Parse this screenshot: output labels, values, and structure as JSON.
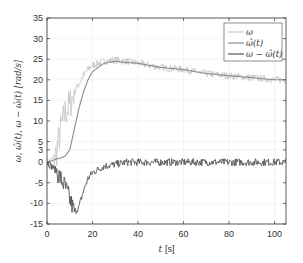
{
  "chart_data": {
    "type": "line",
    "title": "",
    "xlabel": "t [s]",
    "ylabel": "ω, ω̂(t), ω − ω̂(t) [rad/s]",
    "xlim": [
      0,
      105
    ],
    "ylim": [
      -15,
      35
    ],
    "xticks": [
      0,
      20,
      40,
      60,
      80,
      100
    ],
    "yticks": [
      -15,
      -10,
      -5,
      0,
      3,
      5,
      10,
      15,
      20,
      25,
      30,
      35
    ],
    "grid": true,
    "legend_position": "upper right",
    "x": [
      0,
      2,
      4,
      6,
      8,
      10,
      12,
      14,
      16,
      18,
      20,
      25,
      30,
      35,
      40,
      50,
      60,
      70,
      80,
      90,
      100,
      105
    ],
    "series": [
      {
        "name": "ω",
        "color": "#c8c8c8",
        "noisy": true,
        "values": [
          0,
          0.5,
          2,
          8,
          12,
          14,
          17,
          19,
          21,
          22.5,
          23.5,
          24.5,
          24.8,
          24.5,
          24,
          23,
          22.5,
          21.5,
          21,
          20.5,
          20,
          20
        ]
      },
      {
        "name": "ω̂(t)",
        "color": "#8c8c8c",
        "noisy": false,
        "values": [
          0,
          0.3,
          0.8,
          1,
          1.5,
          3,
          8,
          13,
          17,
          20,
          22,
          24,
          24.5,
          24.2,
          24,
          23,
          22.5,
          21.5,
          21,
          20.5,
          20,
          20
        ]
      },
      {
        "name": "ω − ω̂(t)",
        "color": "#555555",
        "noisy": true,
        "values": [
          0,
          -1,
          -2,
          -4,
          -6,
          -9,
          -12,
          -11,
          -7,
          -4,
          -2.5,
          -1,
          -0.5,
          0,
          0,
          0,
          0,
          0,
          0,
          0,
          0,
          0
        ]
      }
    ]
  },
  "axis": {
    "xlabel_t": "t",
    "xlabel_unit": "[s]",
    "ylabel": "ω, ω̂(t), ω − ω̂(t)  [rad/s]"
  },
  "legend": [
    {
      "label": "ω",
      "color": "#c8c8c8"
    },
    {
      "label": "ω̂(t)",
      "color": "#8c8c8c"
    },
    {
      "label": "ω − ω̂(t)",
      "color": "#555555"
    }
  ]
}
